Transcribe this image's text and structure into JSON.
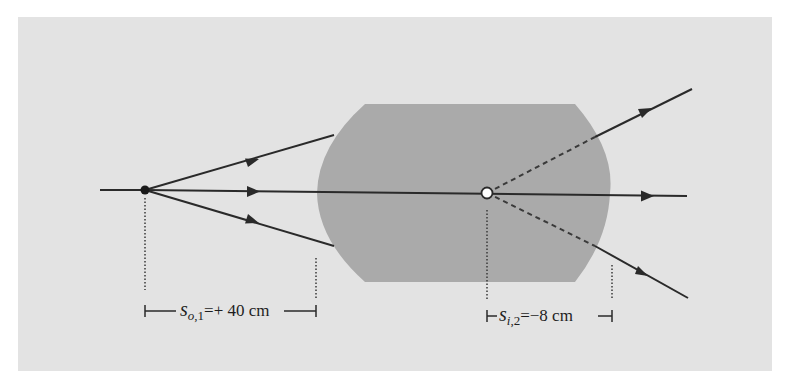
{
  "figure": {
    "background_color": "#e3e3e3",
    "lens_color": "#a9a9a9",
    "ray_color": "#2a2a2a"
  },
  "object_point": {
    "label": "object point",
    "style": "filled black dot"
  },
  "image_point": {
    "label": "virtual image point",
    "style": "hollow white dot"
  },
  "lens": {
    "label": "thick lens (biconvex with flat top and bottom)"
  },
  "rays": {
    "incident_count": 3,
    "emergent_count": 3,
    "virtual_extensions": "dashed"
  },
  "dimensions": {
    "object_distance": {
      "symbol": "s",
      "subscript": "o,1",
      "subscript_italic": "o",
      "subscript_rest": ",1",
      "equals": "=",
      "value": "+ 40 cm"
    },
    "image_distance": {
      "symbol": "s",
      "subscript_italic": "i",
      "subscript_rest": ",2",
      "equals": "=",
      "value": "−8 cm"
    }
  }
}
